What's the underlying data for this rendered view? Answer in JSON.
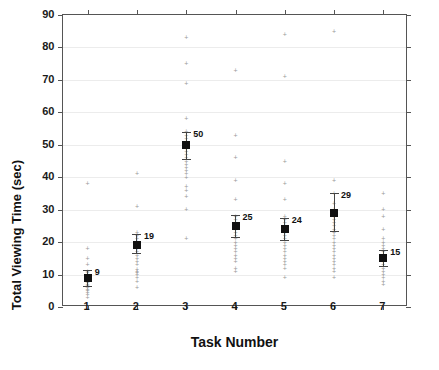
{
  "chart_data": {
    "type": "scatter",
    "title": "",
    "xlabel": "Task Number",
    "ylabel": "Total Viewing Time (sec)",
    "xlim": [
      0.5,
      7.5
    ],
    "ylim": [
      0,
      90
    ],
    "grid": true,
    "legend": "none",
    "yticks": [
      0,
      10,
      20,
      30,
      40,
      50,
      60,
      70,
      80,
      90
    ],
    "xticks": [
      1,
      2,
      3,
      4,
      5,
      6,
      7
    ],
    "categories": [
      "1",
      "2",
      "3",
      "4",
      "5",
      "6",
      "7"
    ],
    "mean_label_format": "integer",
    "series": [
      {
        "name": "Mean total viewing time",
        "values": [
          9,
          19,
          50,
          25,
          24,
          29,
          15
        ],
        "labels": [
          "9",
          "19",
          "50",
          "25",
          "24",
          "29",
          "15"
        ],
        "error_low": [
          6.5,
          16.5,
          45.5,
          21.5,
          20.5,
          23.5,
          12.5
        ],
        "error_high": [
          11.5,
          22.5,
          54.0,
          28.5,
          27.5,
          35.0,
          17.5
        ]
      }
    ],
    "points": [
      {
        "task": 1,
        "values": [
          3,
          4,
          4.5,
          5,
          5.5,
          6,
          6.5,
          7,
          7.5,
          8,
          8.5,
          9,
          9,
          9.5,
          10,
          10.5,
          11,
          13,
          15,
          18,
          38
        ]
      },
      {
        "task": 2,
        "values": [
          6,
          8,
          9,
          10,
          10.5,
          11,
          11.5,
          13,
          14,
          15,
          16,
          17,
          18,
          19,
          19.5,
          20,
          21,
          22,
          23,
          31,
          41
        ]
      },
      {
        "task": 3,
        "values": [
          21,
          30,
          34,
          36,
          37,
          40,
          41,
          42,
          43,
          44,
          45,
          46,
          47,
          48,
          49,
          50,
          51,
          52,
          53,
          54,
          58,
          69,
          75,
          83
        ]
      },
      {
        "task": 4,
        "values": [
          11,
          12,
          14,
          15,
          16,
          17,
          18,
          19,
          20,
          21,
          22,
          23,
          24,
          25,
          26,
          27,
          28,
          33,
          39,
          46,
          53,
          73
        ]
      },
      {
        "task": 5,
        "values": [
          9,
          12,
          13,
          14,
          15,
          16,
          17,
          18,
          19,
          20,
          21,
          22,
          23,
          24,
          25,
          26,
          27,
          28,
          33,
          38,
          45,
          71,
          84
        ]
      },
      {
        "task": 6,
        "values": [
          9,
          11,
          12,
          13,
          14,
          15,
          16,
          17,
          18,
          19,
          20,
          21,
          22,
          23,
          24,
          25,
          26,
          27,
          28,
          29,
          30,
          32,
          35,
          39,
          85
        ]
      },
      {
        "task": 7,
        "values": [
          7,
          8,
          9,
          10,
          11,
          12,
          13,
          14,
          15,
          16,
          17,
          18,
          19,
          20,
          21,
          24,
          28,
          30,
          35
        ]
      }
    ]
  }
}
